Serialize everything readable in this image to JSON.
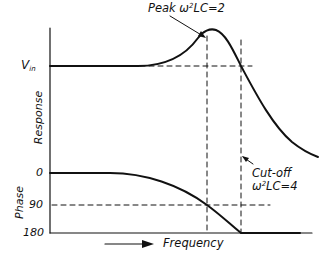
{
  "diagram": {
    "type": "frequency-response",
    "labels": {
      "peak": "Peak ω²LC=2",
      "peak_prefix": "Peak ω",
      "peak_exp": "2",
      "peak_suffix": "LC=2",
      "cutoff_line1": "Cut-off",
      "cutoff_prefix": "ω",
      "cutoff_exp": "2",
      "cutoff_suffix": "LC=4",
      "vin_main": "V",
      "vin_sub": "in",
      "response_axis": "Response",
      "phase_axis": "Phase",
      "phase_ticks": [
        "0",
        "90",
        "180"
      ],
      "x_axis": "Frequency"
    },
    "colors": {
      "ink": "#111111",
      "background": "#ffffff"
    }
  }
}
